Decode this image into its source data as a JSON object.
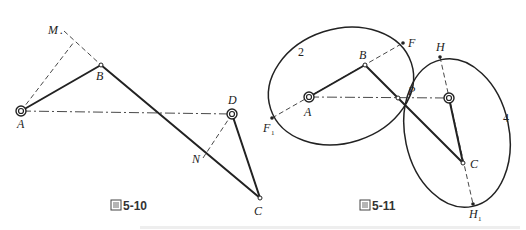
{
  "figure_left": {
    "caption": "图5-10",
    "labels": {
      "A": "A",
      "B": "B",
      "C": "C",
      "D": "D",
      "M": "M",
      "N": "N"
    }
  },
  "figure_right": {
    "caption": "图5-11",
    "labels": {
      "A": "A",
      "B": "B",
      "C": "C",
      "P": "P",
      "F": "F",
      "F1": "F",
      "F1_sub": "1",
      "H": "H",
      "H1": "H",
      "H1_sub": "1",
      "gear2": "2",
      "gear4": "4"
    }
  }
}
